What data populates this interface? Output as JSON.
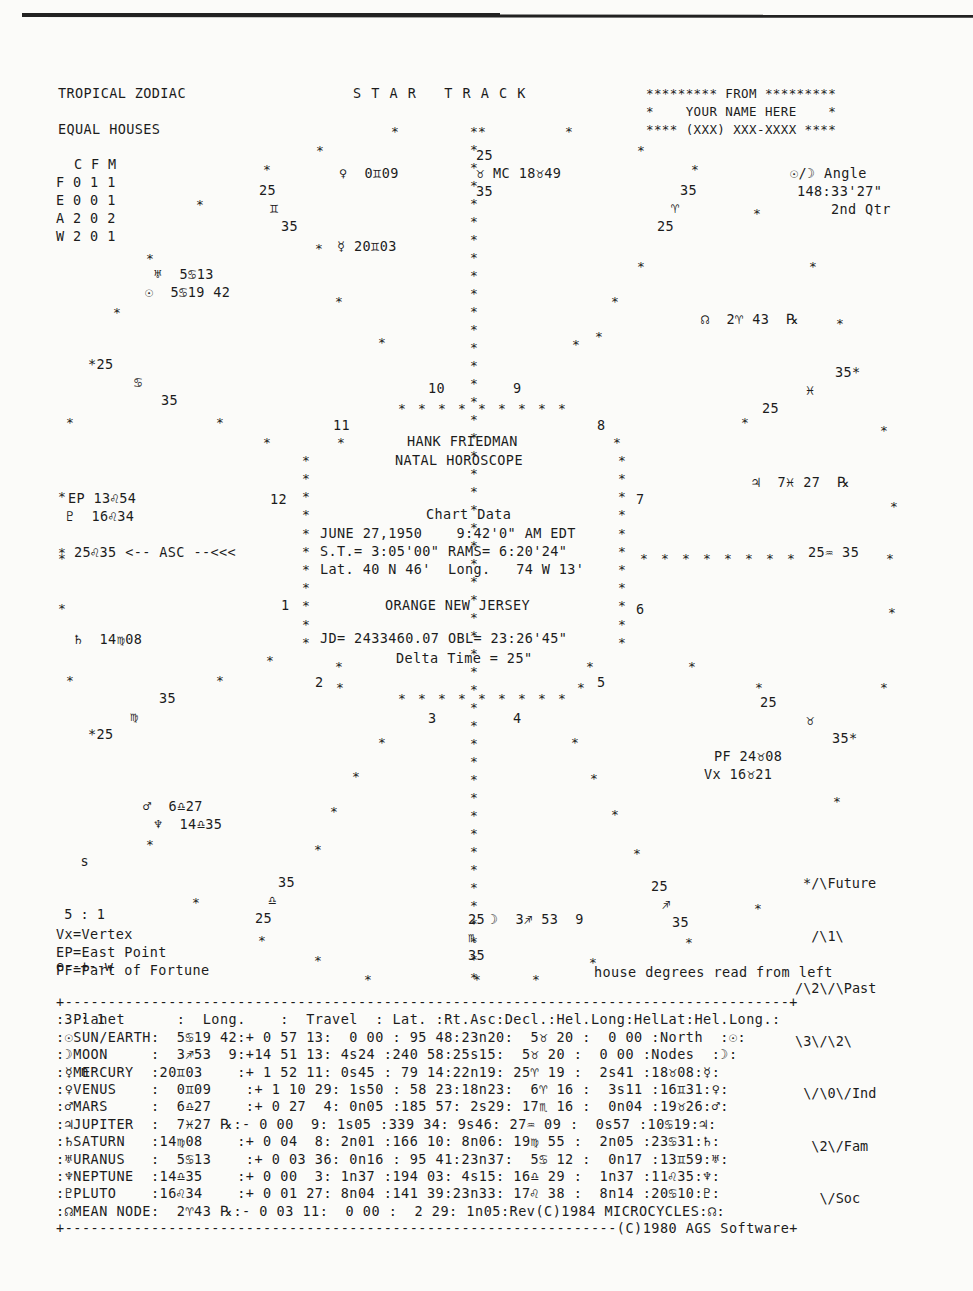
{
  "header": {
    "zodiac": "TROPICAL ZODIAC",
    "houses": "EQUAL HOUSES",
    "title": "S T A R   T R A C K",
    "from_box": [
      "********* FROM *********",
      "*    YOUR NAME HERE    *",
      "**** (XXX) XXX-XXXX ****"
    ]
  },
  "cfm_table": {
    "header": "C F M",
    "rows": [
      "F 0 1 1",
      "E 0 0 1",
      "A 2 0 2",
      "W 2 0 1"
    ]
  },
  "angle_box": {
    "label": "☉/☽ Angle",
    "value": "148:33'27\"",
    "phase": "2nd Qtr"
  },
  "wheel": {
    "planets": [
      {
        "id": "venus",
        "text": "♀  0♊09",
        "x": 339,
        "y": 172
      },
      {
        "id": "mc",
        "text": "♉ MC 18♉49",
        "x": 476,
        "y": 172
      },
      {
        "id": "mercury",
        "text": "☿ 20♊03",
        "x": 337,
        "y": 244
      },
      {
        "id": "uranus",
        "text": "♅  5♋13",
        "x": 156,
        "y": 272
      },
      {
        "id": "sun",
        "text": "☉  5♋19 42",
        "x": 147,
        "y": 290
      },
      {
        "id": "node",
        "text": "☊  2♈ 43  ℞",
        "x": 701,
        "y": 317
      },
      {
        "id": "jupiter",
        "text": "♃  7♓ 27  ℞",
        "x": 752,
        "y": 482
      },
      {
        "id": "ep",
        "text": "EP 13♌54",
        "x": 68,
        "y": 500
      },
      {
        "id": "pluto",
        "text": "♇  16♌34",
        "x": 66,
        "y": 518
      },
      {
        "id": "asc",
        "text": "25♌35 <-- ASC --<<<",
        "x": 68,
        "y": 552
      },
      {
        "id": "saturn",
        "text": "♄  14♍08",
        "x": 74,
        "y": 640
      },
      {
        "id": "pf",
        "text": "PF 24♉08",
        "x": 714,
        "y": 755
      },
      {
        "id": "vx",
        "text": "Vx 16♉21",
        "x": 704,
        "y": 773
      },
      {
        "id": "mars",
        "text": "♂  6♎27",
        "x": 143,
        "y": 804
      },
      {
        "id": "neptune",
        "text": "♆  14♎35",
        "x": 154,
        "y": 822
      },
      {
        "id": "moon",
        "text": "☽  3♐ 53  9",
        "x": 490,
        "y": 918
      },
      {
        "id": "ic-desc",
        "text": "25♒ 35",
        "x": 808,
        "y": 552
      }
    ],
    "cusp_labels": [
      {
        "text": "25",
        "x": 476,
        "y": 154
      },
      {
        "text": "35",
        "x": 476,
        "y": 190
      },
      {
        "text": "25",
        "x": 259,
        "y": 189
      },
      {
        "text": "♊",
        "x": 270,
        "y": 207
      },
      {
        "text": "35",
        "x": 281,
        "y": 225
      },
      {
        "text": "35",
        "x": 680,
        "y": 189
      },
      {
        "text": "♈",
        "x": 671,
        "y": 207
      },
      {
        "text": "25",
        "x": 657,
        "y": 225
      },
      {
        "text": "*25",
        "x": 88,
        "y": 363
      },
      {
        "text": "♋",
        "x": 134,
        "y": 381
      },
      {
        "text": "35",
        "x": 161,
        "y": 399
      },
      {
        "text": "35*",
        "x": 835,
        "y": 371
      },
      {
        "text": "♓",
        "x": 806,
        "y": 389
      },
      {
        "text": "25",
        "x": 762,
        "y": 407
      },
      {
        "text": "35",
        "x": 159,
        "y": 698
      },
      {
        "text": "♍",
        "x": 130,
        "y": 716
      },
      {
        "text": "*25",
        "x": 88,
        "y": 734
      },
      {
        "text": "25",
        "x": 760,
        "y": 702
      },
      {
        "text": "♉",
        "x": 806,
        "y": 720
      },
      {
        "text": "35*",
        "x": 832,
        "y": 738
      },
      {
        "text": "35",
        "x": 278,
        "y": 882
      },
      {
        "text": "♎",
        "x": 268,
        "y": 900
      },
      {
        "text": "25",
        "x": 255,
        "y": 918
      },
      {
        "text": "25",
        "x": 651,
        "y": 886
      },
      {
        "text": "♐",
        "x": 662,
        "y": 904
      },
      {
        "text": "35",
        "x": 672,
        "y": 922
      },
      {
        "text": "25",
        "x": 468,
        "y": 918
      },
      {
        "text": "♏",
        "x": 468,
        "y": 936
      },
      {
        "text": "35",
        "x": 468,
        "y": 954
      }
    ],
    "house_numbers": [
      {
        "n": "10",
        "x": 428,
        "y": 388
      },
      {
        "n": "9",
        "x": 513,
        "y": 388
      },
      {
        "n": "11",
        "x": 333,
        "y": 424
      },
      {
        "n": "8",
        "x": 597,
        "y": 424
      },
      {
        "n": "12",
        "x": 270,
        "y": 500
      },
      {
        "n": "7",
        "x": 636,
        "y": 500
      },
      {
        "n": "1",
        "x": 281,
        "y": 605
      },
      {
        "n": "6",
        "x": 636,
        "y": 605
      },
      {
        "n": "2",
        "x": 315,
        "y": 681
      },
      {
        "n": "5",
        "x": 597,
        "y": 681
      },
      {
        "n": "3",
        "x": 428,
        "y": 717
      },
      {
        "n": "4",
        "x": 513,
        "y": 717
      }
    ],
    "center": {
      "name": "HANK FRIEDMAN",
      "subtitle": "NATAL HOROSCOPE",
      "chart_data_label": "Chart Data",
      "date_line": "JUNE 27,1950    9:42'0\" AM EDT",
      "st_line": "S.T.= 3:05'00\" RAMS= 6:20'24\"",
      "lat_line": "Lat. 40 N 46'  Long.   74 W 13'",
      "location": "ORANGE NEW JERSEY",
      "jd_line": "JD= 2433460.07 OBL= 23:26'45\"",
      "delta_line": "Delta Time = 25\""
    }
  },
  "compass": [
    "   s",
    " 5 : 1",
    "e--+--w",
    " 3 : 1",
    "   n"
  ],
  "legend": [
    "Vx=Vertex",
    "EP=East Point",
    "PF=Part of Fortune"
  ],
  "diamond": [
    "*/\\Future",
    " /\\1\\",
    "/\\2\\/\\Past",
    "\\3\\/\\2\\",
    " \\/\\0\\/Ind",
    "  \\2\\/Fam",
    "   \\/Soc"
  ],
  "house_note": "house degrees read from left",
  "table": {
    "top_border": "+------------------------------------------------------------------------------------+",
    "header": ": Planet      :  Long.    :  Travel  : Lat. :Rt.Asc:Decl.:Hel.Long:HelLat:Hel.Long.:",
    "rows": [
      ":☉SUN/EARTH:  5♋19 42:+ 0 57 13:  0 00 : 95 48:23n20:  5♉ 20 :  0 00 :North  :☉:",
      ":☽MOON     :  3♐53  9:+14 51 13: 4s24 :240 58:25s15:  5♉ 20 :  0 00 :Nodes  :☽:",
      ":☿MERCURY  :20♊03    :+ 1 52 11: 0s45 : 79 14:22n19: 25♈ 19 :  2s41 :18♉08:☿:",
      ":♀VENUS    :  0♊09    :+ 1 10 29: 1s50 : 58 23:18n23:  6♈ 16 :  3s11 :16♊31:♀:",
      ":♂MARS     :  6♎27    :+ 0 27  4: 0n05 :185 57: 2s29: 17♏ 16 :  0n04 :19♉26:♂:",
      ":♃JUPITER  :  7♓27 ℞:- 0 00  9: 1s05 :339 34: 9s46: 27♒ 09 :  0s57 :10♋19:♃:",
      ":♄SATURN   :14♍08    :+ 0 04  8: 2n01 :166 10: 8n06: 19♍ 55 :  2n05 :23♋31:♄:",
      ":♅URANUS   :  5♋13    :+ 0 03 36: 0n16 : 95 41:23n37:  5♋ 12 :  0n17 :13♊59:♅:",
      ":♆NEPTUNE  :14♎35    :+ 0 00  3: 1n37 :194 03: 4s15: 16♎ 29 :  1n37 :11♌35:♆:",
      ":♇PLUTO    :16♌34    :+ 0 01 27: 8n04 :141 39:23n33: 17♌ 38 :  8n14 :20♋10:♇:",
      ":☊MEAN NODE:  2♈43 ℞:- 0 03 11:  0 00 :  2 29: 1n05:Rev(C)1984 MICROCYCLES:☊:"
    ],
    "bottom_border": "+----------------------------------------------------------------(C)1980 AGS Software+"
  }
}
